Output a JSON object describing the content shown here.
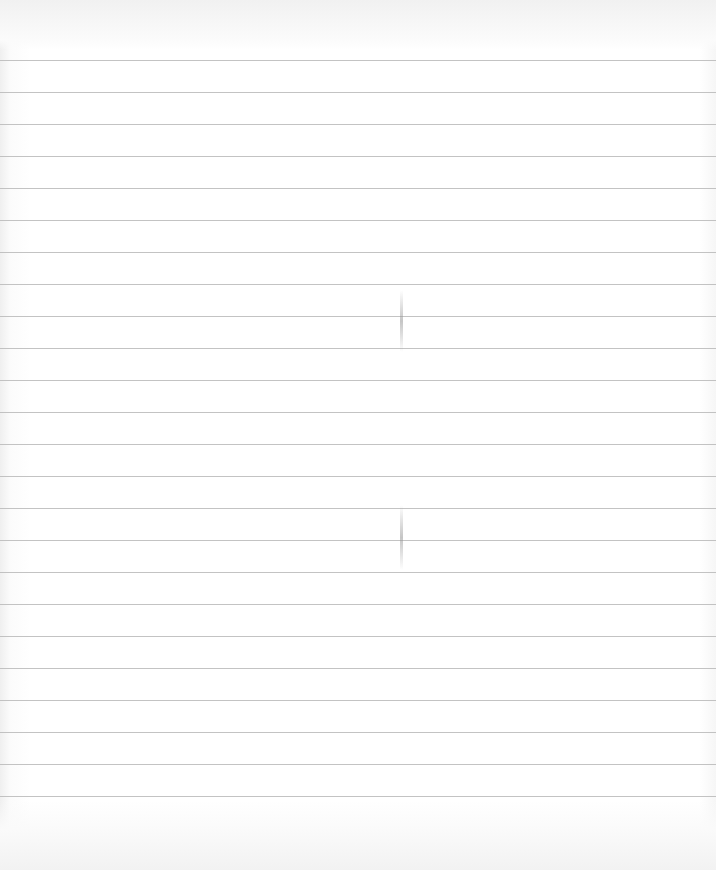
{
  "page": {
    "type": "blank ruled sheet",
    "background_color": "#ffffff",
    "rule_color": "#b9b9b9",
    "text_content": ""
  },
  "rules": {
    "count": 24,
    "first_y": 60,
    "spacing": 32,
    "positions": [
      60,
      92,
      124,
      156,
      188,
      220,
      252,
      284,
      316,
      348,
      380,
      412,
      444,
      476,
      508,
      540,
      572,
      604,
      636,
      668,
      700,
      732,
      764,
      796
    ]
  },
  "marks": [
    {
      "name": "fold-smudge-upper",
      "x": 400,
      "y": 290,
      "height": 62
    },
    {
      "name": "fold-smudge-lower",
      "x": 400,
      "y": 505,
      "height": 65
    }
  ]
}
